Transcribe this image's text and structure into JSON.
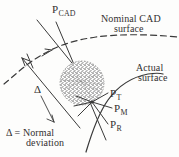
{
  "figure": {
    "name": "normal-deviation-diagram",
    "colors": {
      "ink": "#333030",
      "line": "#3a3a3a",
      "blob_fill": "#9a9a9a",
      "background": "#fdfdfc"
    },
    "labels": {
      "p_cad": {
        "base": "P",
        "sub": "CAD"
      },
      "nominal_surface_line1": "Nominal CAD",
      "nominal_surface_line2": "surface",
      "actual_surface_line1": "Actual",
      "actual_surface_line2": "surface",
      "delta_symbol": "Δ",
      "delta_definition_line1": "Δ = Normal",
      "delta_definition_line2": "deviation",
      "p_t": {
        "base": "P",
        "sub": "T"
      },
      "p_m": {
        "base": "P",
        "sub": "M"
      },
      "p_r": {
        "base": "P",
        "sub": "R"
      }
    },
    "elements": {
      "nominal_curve": "dashed-curve",
      "actual_curve": "solid-curve",
      "measurement_blob": "stippled-circle",
      "normal_line": "long-straight-line",
      "deviation_arrows": "double-headed-arrow"
    }
  }
}
